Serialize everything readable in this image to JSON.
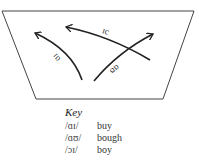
{
  "diagram": {
    "type": "vowel-diphthong-chart",
    "arrows": [
      {
        "label": "ɑɪ",
        "direction": "from bottom-center to upper-left"
      },
      {
        "label": "ɑʊ",
        "direction": "from bottom-center to upper-right"
      },
      {
        "label": "ɔɪ",
        "direction": "from lower-right to upper-left"
      }
    ],
    "labels": {
      "ai": "ɑɪ",
      "au": "ɑʊ",
      "oi": "ɔɪ"
    }
  },
  "key": {
    "title": "Key",
    "rows": [
      {
        "symbol": "/ɑɪ/",
        "word": "buy"
      },
      {
        "symbol": "/ɑʊ/",
        "word": "bough"
      },
      {
        "symbol": "/ɔɪ/",
        "word": "boy"
      }
    ]
  }
}
